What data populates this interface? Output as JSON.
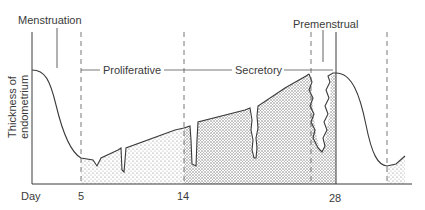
{
  "diagram": {
    "y_axis_label": "Thickness of endometrium",
    "x_axis_label": "Day",
    "x_ticks": [
      "5",
      "14",
      "28"
    ],
    "phases": {
      "menstruation": "Menstruation",
      "proliferative": "Proliferative",
      "secretory": "Secretory",
      "premenstrual": "Premenstrual"
    },
    "colors": {
      "line": "#3a3a3a",
      "stipple": "#8a8a8a",
      "background": "#ffffff"
    }
  }
}
